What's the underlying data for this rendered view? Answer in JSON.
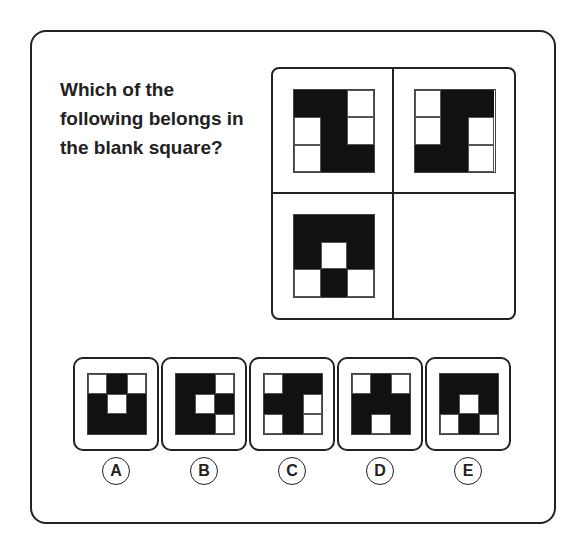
{
  "question": "Which of the following belongs in the blank square?",
  "main_grid": {
    "cells": [
      {
        "position": "top-left",
        "pattern": [
          [
            1,
            1,
            0
          ],
          [
            0,
            1,
            0
          ],
          [
            0,
            1,
            1
          ]
        ]
      },
      {
        "position": "top-right",
        "pattern": [
          [
            0,
            1,
            1
          ],
          [
            0,
            1,
            0
          ],
          [
            1,
            1,
            0
          ]
        ]
      },
      {
        "position": "bottom-left",
        "pattern": [
          [
            1,
            1,
            1
          ],
          [
            1,
            0,
            1
          ],
          [
            0,
            1,
            0
          ]
        ]
      },
      {
        "position": "bottom-right",
        "pattern": null
      }
    ]
  },
  "options": [
    {
      "label": "A",
      "pattern": [
        [
          0,
          1,
          0
        ],
        [
          1,
          0,
          1
        ],
        [
          1,
          1,
          1
        ]
      ]
    },
    {
      "label": "B",
      "pattern": [
        [
          1,
          1,
          0
        ],
        [
          1,
          0,
          1
        ],
        [
          1,
          1,
          0
        ]
      ]
    },
    {
      "label": "C",
      "pattern": [
        [
          0,
          1,
          1
        ],
        [
          1,
          1,
          0
        ],
        [
          0,
          1,
          0
        ]
      ]
    },
    {
      "label": "D",
      "pattern": [
        [
          0,
          1,
          0
        ],
        [
          1,
          1,
          1
        ],
        [
          1,
          0,
          1
        ]
      ]
    },
    {
      "label": "E",
      "pattern": [
        [
          1,
          1,
          1
        ],
        [
          1,
          0,
          1
        ],
        [
          0,
          1,
          0
        ]
      ]
    }
  ],
  "colors": {
    "filled": "#111111",
    "empty": "#ffffff",
    "border": "#222222"
  }
}
